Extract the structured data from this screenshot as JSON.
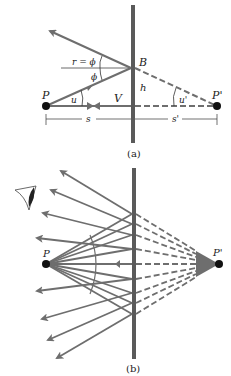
{
  "colors": {
    "ray": "#6e6e6e",
    "mirror": "#5a5a5a",
    "point": "#111111",
    "text": "#222222"
  },
  "panel_a": {
    "caption": "(a)",
    "labels": {
      "P": "P",
      "P_prime": "P'",
      "B": "B",
      "V": "V",
      "h": "h",
      "u": "u",
      "u_prime": "u'",
      "r_eq_phi": "r = ϕ",
      "phi": "ϕ",
      "s": "s",
      "s_prime": "s'"
    }
  },
  "panel_b": {
    "caption": "(b)",
    "labels": {
      "P": "P",
      "P_prime": "P'"
    },
    "icons": [
      "eye-icon"
    ]
  }
}
